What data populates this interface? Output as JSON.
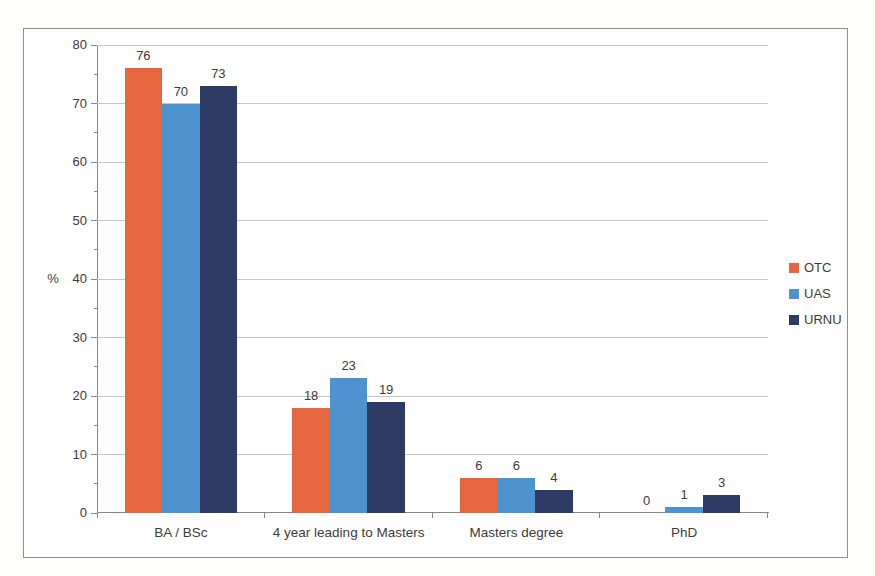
{
  "chart_data": {
    "type": "bar",
    "title": "",
    "categories": [
      "BA / BSc",
      "4 year leading to Masters",
      "Masters degree",
      "PhD"
    ],
    "series": [
      {
        "name": "OTC",
        "color": "#e5663f",
        "values": [
          76,
          18,
          6,
          0
        ]
      },
      {
        "name": "UAS",
        "color": "#4d93d0",
        "values": [
          70,
          23,
          6,
          1
        ]
      },
      {
        "name": "URNU",
        "color": "#2d3a64",
        "values": [
          73,
          19,
          4,
          3
        ]
      }
    ],
    "xlabel": "",
    "ylabel": "%",
    "ylim": [
      0,
      80
    ],
    "yticks": [
      0,
      10,
      20,
      30,
      40,
      50,
      60,
      70,
      80
    ],
    "minor_tick_interval": 5,
    "grid": true,
    "legend_position": "right",
    "value_labels_shown": true
  },
  "style": {
    "text_color": "#3d3c3a",
    "gridline_color": "#c9c7c3",
    "axis_color": "#8a8884",
    "frame_border_color": "#918f8b",
    "page_background": "#fdfdfc"
  }
}
